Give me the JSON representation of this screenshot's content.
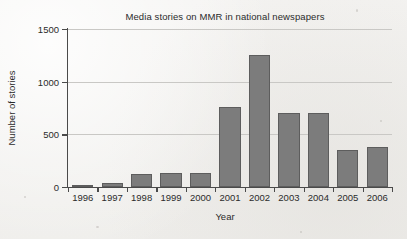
{
  "chart_data": {
    "type": "bar",
    "title": "Media stories on MMR in national newspapers",
    "xlabel": "Year",
    "ylabel": "Number of stories",
    "categories": [
      "1996",
      "1997",
      "1998",
      "1999",
      "2000",
      "2001",
      "2002",
      "2003",
      "2004",
      "2005",
      "2006"
    ],
    "values": [
      20,
      35,
      125,
      130,
      135,
      760,
      1255,
      705,
      700,
      355,
      380
    ],
    "ylim": [
      0,
      1500
    ],
    "yticks": [
      0,
      500,
      1000,
      1500
    ],
    "ytick_labels": [
      "0",
      "500",
      "1000",
      "1500"
    ],
    "grid": true,
    "legend": null,
    "series": [
      {
        "name": "Number of stories",
        "values": [
          20,
          35,
          125,
          130,
          135,
          760,
          1255,
          705,
          700,
          355,
          380
        ]
      }
    ],
    "colors": {
      "bar_fill": "#7c7c7c",
      "bar_border": "#5d5d5d",
      "gridline": "#c9c8c5",
      "axis": "#4a4a4a",
      "text": "#2b2b2b",
      "background": "#f2f1ef"
    }
  }
}
